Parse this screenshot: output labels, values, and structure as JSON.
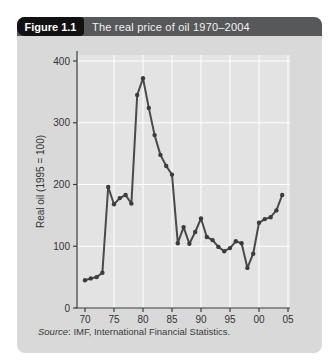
{
  "header": {
    "figure_label": "Figure 1.1",
    "title": "The real price of oil 1970–2004"
  },
  "source": {
    "label": "Source",
    "text": ": IMF, International Financial Statistics."
  },
  "chart_data": {
    "type": "line",
    "series_name": "Real price of oil",
    "x": [
      1970,
      1971,
      1972,
      1973,
      1974,
      1975,
      1976,
      1977,
      1978,
      1979,
      1980,
      1981,
      1982,
      1983,
      1984,
      1985,
      1986,
      1987,
      1988,
      1989,
      1990,
      1991,
      1992,
      1993,
      1994,
      1995,
      1996,
      1997,
      1998,
      1999,
      2000,
      2001,
      2002,
      2003,
      2004
    ],
    "values": [
      45,
      48,
      50,
      57,
      196,
      168,
      178,
      183,
      169,
      345,
      372,
      324,
      280,
      248,
      230,
      216,
      105,
      131,
      104,
      123,
      145,
      115,
      110,
      99,
      92,
      97,
      108,
      105,
      65,
      88,
      138,
      144,
      147,
      158,
      183
    ],
    "title": "The real price of oil 1970–2004",
    "xlabel": "",
    "ylabel": "Real oil (1995 = 100)",
    "ylim": [
      0,
      400
    ],
    "yticks": [
      0,
      100,
      200,
      300,
      400
    ],
    "xtick_years": [
      1970,
      1975,
      1980,
      1985,
      1990,
      1995,
      2000,
      2005
    ],
    "xtick_labels": [
      "70",
      "75",
      "80",
      "85",
      "90",
      "95",
      "00",
      "05"
    ],
    "grid": true,
    "legend_position": "none"
  },
  "colors": {
    "panel_bg": "#d9d9d9",
    "header_bg": "#57585a",
    "figure_box_bg": "#111111",
    "header_text": "#ffffff",
    "plot_bg": "#e3e3e3",
    "grid": "#ffffff",
    "axis": "#3c3c3c",
    "line": "#4a4a4a",
    "marker": "#3c3c3c",
    "tick_text": "#333333"
  }
}
